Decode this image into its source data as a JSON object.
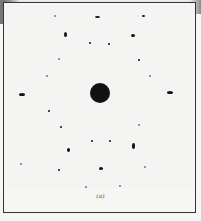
{
  "figure": {
    "caption": "(a)",
    "colors": {
      "background": "#f6f6f4",
      "spots": "#111111",
      "frame": "#333333"
    },
    "center_spot": {
      "x": 100,
      "y": 93,
      "diameter": 20
    },
    "spots": [
      {
        "x": 55,
        "y": 16,
        "w": 2,
        "h": 2,
        "faint": true
      },
      {
        "x": 97,
        "y": 17,
        "w": 5,
        "h": 2,
        "faint": false
      },
      {
        "x": 143,
        "y": 16,
        "w": 3,
        "h": 2,
        "faint": false
      },
      {
        "x": 65,
        "y": 34,
        "w": 3,
        "h": 5,
        "faint": false
      },
      {
        "x": 133,
        "y": 35,
        "w": 4,
        "h": 3,
        "faint": false
      },
      {
        "x": 90,
        "y": 43,
        "w": 2,
        "h": 2,
        "faint": false
      },
      {
        "x": 109,
        "y": 44,
        "w": 2,
        "h": 2,
        "faint": false
      },
      {
        "x": 59,
        "y": 59,
        "w": 2,
        "h": 2,
        "faint": true
      },
      {
        "x": 139,
        "y": 60,
        "w": 2,
        "h": 2,
        "faint": false
      },
      {
        "x": 47,
        "y": 76,
        "w": 2,
        "h": 2,
        "faint": true
      },
      {
        "x": 150,
        "y": 76,
        "w": 2,
        "h": 2,
        "faint": true
      },
      {
        "x": 22,
        "y": 94,
        "w": 6,
        "h": 3,
        "faint": false
      },
      {
        "x": 170,
        "y": 92,
        "w": 6,
        "h": 3,
        "faint": false
      },
      {
        "x": 49,
        "y": 111,
        "w": 2,
        "h": 2,
        "faint": false
      },
      {
        "x": 61,
        "y": 127,
        "w": 2,
        "h": 2,
        "faint": false
      },
      {
        "x": 139,
        "y": 125,
        "w": 2,
        "h": 2,
        "faint": true
      },
      {
        "x": 92,
        "y": 141,
        "w": 2,
        "h": 2,
        "faint": false
      },
      {
        "x": 110,
        "y": 141,
        "w": 2,
        "h": 2,
        "faint": false
      },
      {
        "x": 68,
        "y": 150,
        "w": 3,
        "h": 4,
        "faint": false
      },
      {
        "x": 133,
        "y": 146,
        "w": 3,
        "h": 6,
        "faint": false
      },
      {
        "x": 21,
        "y": 164,
        "w": 2,
        "h": 2,
        "faint": true
      },
      {
        "x": 59,
        "y": 170,
        "w": 2,
        "h": 2,
        "faint": false
      },
      {
        "x": 101,
        "y": 168,
        "w": 4,
        "h": 3,
        "faint": false
      },
      {
        "x": 145,
        "y": 167,
        "w": 2,
        "h": 2,
        "faint": true
      },
      {
        "x": 86,
        "y": 187,
        "w": 2,
        "h": 2,
        "faint": true
      },
      {
        "x": 120,
        "y": 186,
        "w": 2,
        "h": 2,
        "faint": true
      }
    ]
  }
}
